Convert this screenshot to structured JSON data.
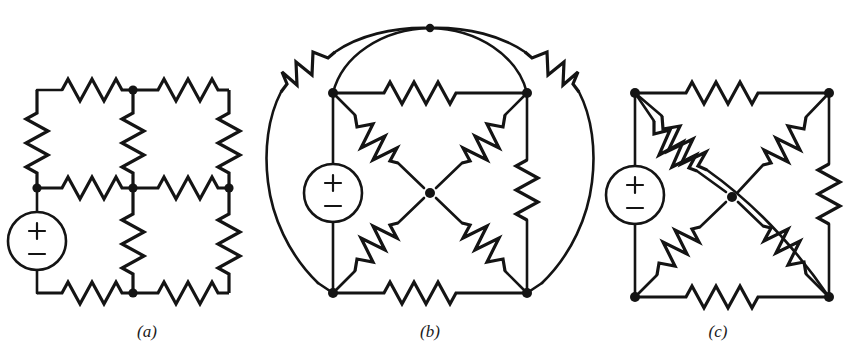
{
  "figure": {
    "background_color": "#ffffff",
    "ink_color": "#141414",
    "panel_count": 3
  },
  "captions": {
    "a": "(a)",
    "b": "(b)",
    "c": "(c)"
  },
  "source_symbol": {
    "plus_label": "+",
    "minus_label": "−",
    "shape": "circle"
  },
  "panels": [
    {
      "id": "a",
      "caption": "(a)",
      "topology": "two-by-two ladder grid",
      "node_count": 9,
      "resistor_count": 8,
      "source_count": 1,
      "source_position": "left branch, lower half",
      "resistors": [
        "top-left horizontal",
        "top-right horizontal",
        "upper-left vertical",
        "middle vertical (center column, upper)",
        "upper-right vertical",
        "middle-left horizontal",
        "middle-right horizontal",
        "center column lower vertical",
        "lower-right vertical",
        "bottom-left horizontal",
        "bottom-right horizontal"
      ]
    },
    {
      "id": "b",
      "caption": "(b)",
      "topology": "square bridge with centre node and two outer arcs",
      "node_count": 5,
      "resistor_count": 8,
      "source_count": 1,
      "source_position": "left edge of square",
      "resistors": [
        "top edge horizontal",
        "bottom edge horizontal",
        "right edge vertical",
        "diagonal top-left to centre",
        "diagonal top-right to centre",
        "diagonal bottom-left to centre",
        "diagonal bottom-right to centre",
        "left outer arc",
        "right outer arc"
      ]
    },
    {
      "id": "c",
      "caption": "(c)",
      "topology": "square bridge with centre node and long corner-to-corner diagonal",
      "node_count": 5,
      "resistor_count": 8,
      "source_count": 1,
      "source_position": "left edge of square",
      "resistors": [
        "top edge horizontal",
        "bottom edge horizontal",
        "right edge vertical",
        "diagonal top-left to centre",
        "diagonal top-right to centre",
        "diagonal bottom-left to centre",
        "diagonal bottom-right to centre",
        "long diagonal top-left to bottom-right"
      ]
    }
  ]
}
